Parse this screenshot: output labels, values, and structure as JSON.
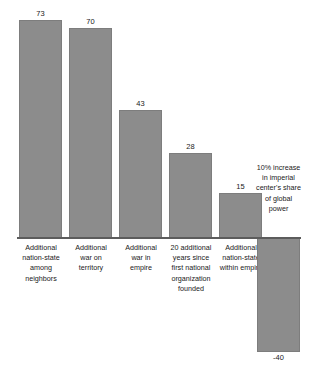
{
  "chart_data": {
    "type": "bar",
    "title": "",
    "subtitle": "",
    "xlabel": "",
    "ylabel": "",
    "grid": false,
    "legend": "none",
    "ylim": [
      -40,
      73
    ],
    "zero_line": true,
    "orientation": "vertical",
    "bar_color": "#8c8c8c",
    "categories": [
      "Additional nation-state among neighbors",
      "Additional war on territory",
      "Additional war in empire",
      "20 additional years since first national organization founded",
      "Additional nation-state within empire",
      "10% increase in imperial center's share of global power"
    ],
    "values": [
      73,
      70,
      43,
      28,
      15,
      -40
    ],
    "value_labels": [
      "73",
      "70",
      "43",
      "28",
      "15",
      "-40"
    ],
    "annotations": [
      {
        "index": 5,
        "text": "10% increase in imperial center's share of global power",
        "position": "above-axis"
      }
    ]
  },
  "chart": {
    "bars": [
      {
        "label_lines": [
          "Additional",
          "nation-state",
          "among",
          "neighbors"
        ],
        "value_label": "73",
        "note": "",
        "x": 19,
        "width": 43,
        "top": 20,
        "height": 218,
        "value_x": 19,
        "value_y": 9,
        "label_x": 13,
        "label_y": 243,
        "label_w": 56
      },
      {
        "label_lines": [
          "Additional",
          "war on",
          "territory"
        ],
        "value_label": "70",
        "note": "",
        "x": 69,
        "width": 43,
        "top": 28,
        "height": 210,
        "value_x": 69,
        "value_y": 17,
        "label_x": 63,
        "label_y": 243,
        "label_w": 56
      },
      {
        "label_lines": [
          "Additional",
          "war in",
          "empire"
        ],
        "value_label": "43",
        "note": "",
        "x": 119,
        "width": 43,
        "top": 110,
        "height": 128,
        "value_x": 119,
        "value_y": 99,
        "label_x": 113,
        "label_y": 243,
        "label_w": 56
      },
      {
        "label_lines": [
          "20 additional",
          "years since",
          "first national",
          "organization",
          "founded"
        ],
        "value_label": "28",
        "note": "",
        "x": 169,
        "width": 43,
        "top": 153,
        "height": 85,
        "value_x": 169,
        "value_y": 142,
        "label_x": 160,
        "label_y": 243,
        "label_w": 62
      },
      {
        "label_lines": [
          "Additional",
          "nation-state",
          "within empire"
        ],
        "value_label": "15",
        "note": "",
        "x": 219,
        "width": 43,
        "top": 193,
        "height": 45,
        "value_x": 219,
        "value_y": 182,
        "label_x": 211,
        "label_y": 243,
        "label_w": 60
      },
      {
        "label_lines": [],
        "value_label": "-40",
        "note": "10% increase in imperial center's share of global power",
        "x": 257,
        "width": 43,
        "top": 238,
        "height": 114,
        "value_x": 257,
        "value_y": 353,
        "label_x": 0,
        "label_y": 0,
        "label_w": 0,
        "note_x": 255,
        "note_y": 163,
        "note_w": 47
      }
    ]
  }
}
